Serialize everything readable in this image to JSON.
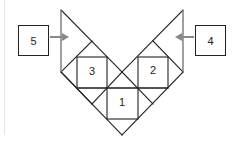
{
  "diagram": {
    "colors": {
      "line": "#222222",
      "arrow": "#888888",
      "frame": "#e4e4e4"
    },
    "external_boxes": [
      {
        "id": "box-5",
        "label": "5",
        "x": 18,
        "y": 25,
        "w": 31,
        "h": 31,
        "arrow_direction": "right"
      },
      {
        "id": "box-4",
        "label": "4",
        "x": 195,
        "y": 25,
        "w": 31,
        "h": 31,
        "arrow_direction": "left"
      }
    ],
    "inner_squares": [
      {
        "id": "square-3",
        "label": "3",
        "x": 77,
        "y": 57,
        "size": 30
      },
      {
        "id": "square-2",
        "label": "2",
        "x": 138,
        "y": 57,
        "size": 30
      },
      {
        "id": "square-1",
        "label": "1",
        "x": 107,
        "y": 88,
        "size": 31
      }
    ]
  }
}
